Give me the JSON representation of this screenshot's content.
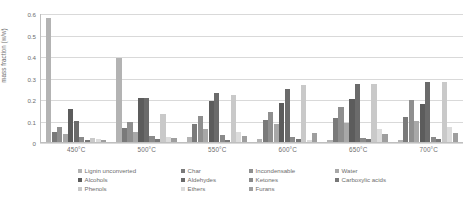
{
  "chart_data": {
    "type": "bar",
    "title": "",
    "xlabel": "",
    "ylabel": "mass fraction (w/w)",
    "categories": [
      "450°C",
      "500°C",
      "550°C",
      "600°C",
      "650°C",
      "700°C"
    ],
    "ylim": [
      0,
      0.6
    ],
    "yticks": [
      "0",
      "0.1",
      "0.2",
      "0.3",
      "0.4",
      "0.5",
      "0.6"
    ],
    "ytick_values": [
      0,
      0.1,
      0.2,
      0.3,
      0.4,
      0.5,
      0.6
    ],
    "grid": true,
    "legend_position": "bottom",
    "series": [
      {
        "name": "Lignin unconverted",
        "color": "#b3b3b3",
        "values": [
          0.575,
          0.39,
          0.022,
          0.012,
          0.01,
          0.009
        ]
      },
      {
        "name": "Char",
        "color": "#7a7a7a",
        "values": [
          0.048,
          0.066,
          0.082,
          0.103,
          0.11,
          0.118
        ]
      },
      {
        "name": "Incondensable",
        "color": "#8f8f8f",
        "values": [
          0.068,
          0.093,
          0.12,
          0.14,
          0.165,
          0.196
        ]
      },
      {
        "name": "Water",
        "color": "#a8a8a8",
        "values": [
          0.035,
          0.047,
          0.062,
          0.083,
          0.09,
          0.1
        ]
      },
      {
        "name": "Alcohols",
        "color": "#5c5c5c",
        "values": [
          0.152,
          0.205,
          0.192,
          0.183,
          0.2,
          0.178
        ]
      },
      {
        "name": "Aldehydes",
        "color": "#6b6b6b",
        "values": [
          0.098,
          0.205,
          0.228,
          0.245,
          0.268,
          0.28
        ]
      },
      {
        "name": "Ketones",
        "color": "#8a8a8a",
        "values": [
          0.022,
          0.028,
          0.033,
          0.022,
          0.02,
          0.024
        ]
      },
      {
        "name": "Carboxylic acids",
        "color": "#787878",
        "values": [
          0.009,
          0.012,
          0.01,
          0.012,
          0.014,
          0.016
        ]
      },
      {
        "name": "Phenols",
        "color": "#c9c9c9",
        "values": [
          0.02,
          0.128,
          0.218,
          0.265,
          0.268,
          0.28
        ]
      },
      {
        "name": "Ethers",
        "color": "#dcdcdc",
        "values": [
          0.012,
          0.022,
          0.048,
          0.01,
          0.062,
          0.072
        ]
      },
      {
        "name": "Furans",
        "color": "#9e9e9e",
        "values": [
          0.01,
          0.018,
          0.026,
          0.04,
          0.038,
          0.044
        ]
      }
    ],
    "legend_columns": [
      [
        "Lignin unconverted",
        "Alcohols",
        "Phenols"
      ],
      [
        "Char",
        "Aldehydes",
        "Ethers"
      ],
      [
        "Incondensable",
        "Ketones",
        "Furans"
      ],
      [
        "Water",
        "Carboxylic acids"
      ]
    ],
    "legend_colors": {
      "Lignin unconverted": "#b3b3b3",
      "Char": "#7a7a7a",
      "Incondensable": "#8f8f8f",
      "Water": "#a8a8a8",
      "Alcohols": "#5c5c5c",
      "Aldehydes": "#6b6b6b",
      "Ketones": "#8a8a8a",
      "Carboxylic acids": "#787878",
      "Phenols": "#c9c9c9",
      "Ethers": "#dcdcdc",
      "Furans": "#9e9e9e"
    }
  }
}
